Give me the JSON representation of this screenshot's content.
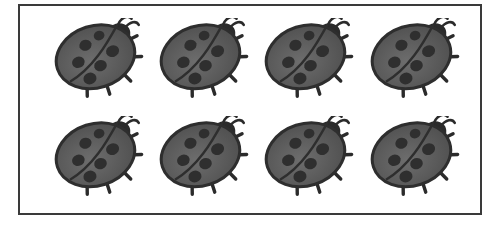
{
  "scene": {
    "title": "Eight ladybugs arranged in a bordered counting frame",
    "background_color": "#ffffff",
    "canvas": {
      "width": 501,
      "height": 226
    }
  },
  "frame": {
    "name": "picture-frame",
    "border_color": "#3a3a3a",
    "border_width_px": 2,
    "fill_color": "#ffffff",
    "x": 18,
    "y": 4,
    "width": 464,
    "height": 211
  },
  "counting_set": {
    "object_name": "ladybug",
    "total_count": 8,
    "rows": 2,
    "columns": 4,
    "count_label": "8"
  },
  "ladybug_style": {
    "body_fill_light": "#6d6d6d",
    "body_fill_mid": "#5a5a5a",
    "body_fill_dark": "#4a4a4a",
    "outline_color": "#2e2e2e",
    "spot_color": "#2f2f2f",
    "head_color": "#2b2b2b",
    "leg_color": "#2b2b2b",
    "antenna_color": "#2b2b2b",
    "spot_count": 6,
    "rotation_degrees": -18
  },
  "ladybugs": [
    {
      "id": "ladybug-1",
      "row": 1,
      "column": 1,
      "x": 32,
      "y": 12,
      "label": "ladybug 1"
    },
    {
      "id": "ladybug-2",
      "row": 1,
      "column": 2,
      "x": 137,
      "y": 12,
      "label": "ladybug 2"
    },
    {
      "id": "ladybug-3",
      "row": 1,
      "column": 3,
      "x": 242,
      "y": 12,
      "label": "ladybug 3"
    },
    {
      "id": "ladybug-4",
      "row": 1,
      "column": 4,
      "x": 348,
      "y": 12,
      "label": "ladybug 4"
    },
    {
      "id": "ladybug-5",
      "row": 2,
      "column": 1,
      "x": 32,
      "y": 110,
      "label": "ladybug 5"
    },
    {
      "id": "ladybug-6",
      "row": 2,
      "column": 2,
      "x": 137,
      "y": 110,
      "label": "ladybug 6"
    },
    {
      "id": "ladybug-7",
      "row": 2,
      "column": 3,
      "x": 242,
      "y": 110,
      "label": "ladybug 7"
    },
    {
      "id": "ladybug-8",
      "row": 2,
      "column": 4,
      "x": 348,
      "y": 110,
      "label": "ladybug 8"
    }
  ],
  "spot_layout": [
    {
      "cx": 38,
      "cy": 24,
      "rx": 6.2,
      "ry": 5.4
    },
    {
      "cx": 54,
      "cy": 19,
      "rx": 5.4,
      "ry": 4.8
    },
    {
      "cx": 26,
      "cy": 38,
      "rx": 6.4,
      "ry": 5.6
    },
    {
      "cx": 62,
      "cy": 38,
      "rx": 6.6,
      "ry": 5.8
    },
    {
      "cx": 46,
      "cy": 48,
      "rx": 6.4,
      "ry": 5.6
    },
    {
      "cx": 32,
      "cy": 57,
      "rx": 6.6,
      "ry": 5.8
    }
  ]
}
